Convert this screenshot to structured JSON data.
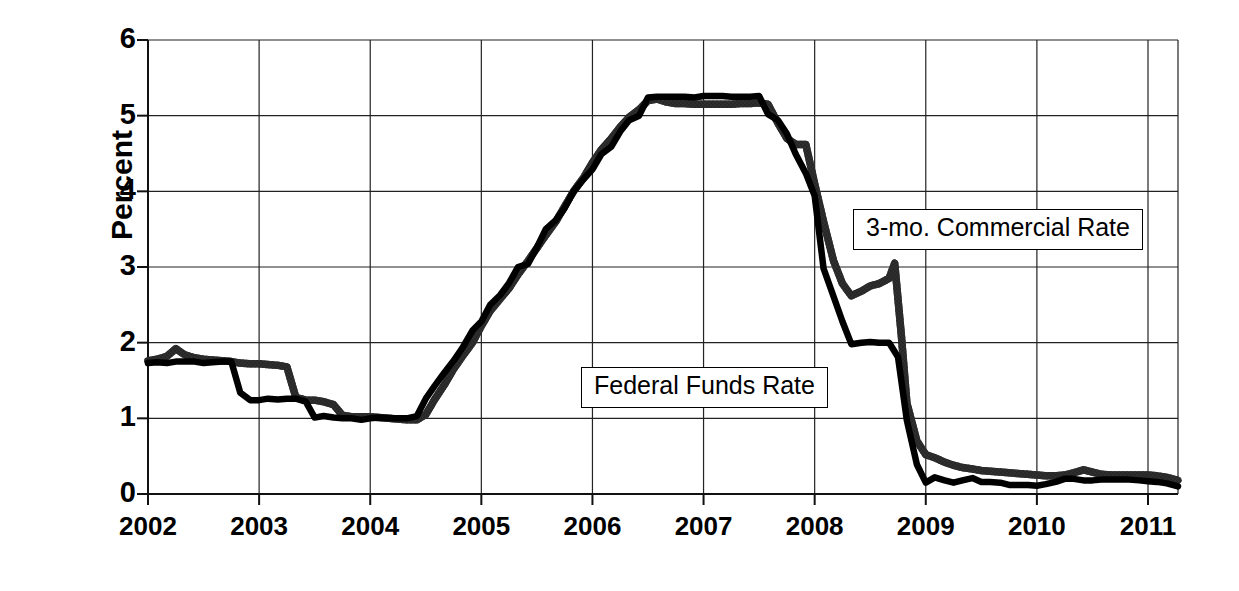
{
  "chart_data": {
    "type": "line",
    "title": "",
    "xlabel": "",
    "ylabel": "Percent",
    "xlim": [
      2002.0,
      2011.27
    ],
    "ylim": [
      0,
      6
    ],
    "grid": true,
    "yticks": [
      0,
      1,
      2,
      3,
      4,
      5,
      6
    ],
    "xticks": [
      2002,
      2003,
      2004,
      2005,
      2006,
      2007,
      2008,
      2009,
      2010,
      2011
    ],
    "ytick_labels": [
      "0",
      "1",
      "2",
      "3",
      "4",
      "5",
      "6"
    ],
    "xtick_labels": [
      "2002",
      "2003",
      "2004",
      "2005",
      "2006",
      "2007",
      "2008",
      "2009",
      "2010",
      "2011"
    ],
    "legend_position": "inline-callouts",
    "series": [
      {
        "name": "3-mo. Commercial Rate",
        "color": "#3a3a3a",
        "style": "textured-gray",
        "x": [
          2002.0,
          2002.08,
          2002.17,
          2002.25,
          2002.33,
          2002.42,
          2002.5,
          2002.58,
          2002.67,
          2002.75,
          2002.83,
          2002.92,
          2003.0,
          2003.08,
          2003.17,
          2003.25,
          2003.33,
          2003.42,
          2003.5,
          2003.58,
          2003.67,
          2003.75,
          2003.83,
          2003.92,
          2004.0,
          2004.08,
          2004.17,
          2004.25,
          2004.33,
          2004.42,
          2004.5,
          2004.58,
          2004.67,
          2004.75,
          2004.83,
          2004.92,
          2005.0,
          2005.08,
          2005.17,
          2005.25,
          2005.33,
          2005.42,
          2005.5,
          2005.58,
          2005.67,
          2005.75,
          2005.83,
          2005.92,
          2006.0,
          2006.08,
          2006.17,
          2006.25,
          2006.33,
          2006.42,
          2006.5,
          2006.58,
          2006.67,
          2006.75,
          2006.83,
          2006.92,
          2007.0,
          2007.08,
          2007.17,
          2007.25,
          2007.33,
          2007.42,
          2007.5,
          2007.58,
          2007.67,
          2007.75,
          2007.83,
          2007.92,
          2008.0,
          2008.08,
          2008.17,
          2008.25,
          2008.33,
          2008.42,
          2008.5,
          2008.58,
          2008.67,
          2008.72,
          2008.78,
          2008.83,
          2008.92,
          2009.0,
          2009.08,
          2009.17,
          2009.25,
          2009.33,
          2009.42,
          2009.5,
          2009.58,
          2009.67,
          2009.75,
          2009.83,
          2009.92,
          2010.0,
          2010.08,
          2010.17,
          2010.25,
          2010.33,
          2010.42,
          2010.5,
          2010.58,
          2010.67,
          2010.75,
          2010.83,
          2010.92,
          2011.0,
          2011.08,
          2011.17,
          2011.27
        ],
        "y": [
          1.76,
          1.78,
          1.82,
          1.92,
          1.84,
          1.8,
          1.78,
          1.77,
          1.76,
          1.75,
          1.73,
          1.72,
          1.72,
          1.71,
          1.7,
          1.68,
          1.28,
          1.24,
          1.24,
          1.22,
          1.18,
          1.04,
          1.02,
          1.02,
          1.02,
          1.01,
          1.0,
          0.99,
          0.98,
          0.98,
          1.05,
          1.25,
          1.45,
          1.65,
          1.82,
          2.0,
          2.22,
          2.42,
          2.58,
          2.72,
          2.9,
          3.08,
          3.25,
          3.42,
          3.6,
          3.8,
          4.0,
          4.18,
          4.38,
          4.55,
          4.7,
          4.85,
          4.98,
          5.08,
          5.2,
          5.22,
          5.18,
          5.16,
          5.16,
          5.15,
          5.15,
          5.15,
          5.15,
          5.15,
          5.16,
          5.16,
          5.17,
          5.15,
          4.9,
          4.7,
          4.62,
          4.62,
          4.1,
          3.6,
          3.08,
          2.78,
          2.62,
          2.68,
          2.75,
          2.78,
          2.85,
          3.05,
          2.1,
          1.2,
          0.7,
          0.52,
          0.48,
          0.42,
          0.38,
          0.35,
          0.33,
          0.31,
          0.3,
          0.29,
          0.28,
          0.27,
          0.26,
          0.25,
          0.24,
          0.24,
          0.25,
          0.28,
          0.32,
          0.29,
          0.26,
          0.25,
          0.25,
          0.25,
          0.25,
          0.25,
          0.24,
          0.22,
          0.18
        ]
      },
      {
        "name": "Federal Funds Rate",
        "color": "#000000",
        "style": "solid-black",
        "x": [
          2002.0,
          2002.08,
          2002.17,
          2002.25,
          2002.33,
          2002.42,
          2002.5,
          2002.58,
          2002.67,
          2002.75,
          2002.83,
          2002.92,
          2003.0,
          2003.08,
          2003.17,
          2003.25,
          2003.33,
          2003.42,
          2003.5,
          2003.58,
          2003.67,
          2003.75,
          2003.83,
          2003.92,
          2004.0,
          2004.08,
          2004.17,
          2004.25,
          2004.33,
          2004.42,
          2004.5,
          2004.58,
          2004.67,
          2004.75,
          2004.83,
          2004.92,
          2005.0,
          2005.08,
          2005.17,
          2005.25,
          2005.33,
          2005.42,
          2005.5,
          2005.58,
          2005.67,
          2005.75,
          2005.83,
          2005.92,
          2006.0,
          2006.08,
          2006.17,
          2006.25,
          2006.33,
          2006.42,
          2006.5,
          2006.58,
          2006.67,
          2006.75,
          2006.83,
          2006.92,
          2007.0,
          2007.08,
          2007.17,
          2007.25,
          2007.33,
          2007.42,
          2007.5,
          2007.58,
          2007.67,
          2007.75,
          2007.83,
          2007.92,
          2008.0,
          2008.08,
          2008.17,
          2008.25,
          2008.33,
          2008.42,
          2008.5,
          2008.58,
          2008.67,
          2008.75,
          2008.83,
          2008.92,
          2009.0,
          2009.08,
          2009.17,
          2009.25,
          2009.33,
          2009.42,
          2009.5,
          2009.58,
          2009.67,
          2009.75,
          2009.83,
          2009.92,
          2010.0,
          2010.08,
          2010.17,
          2010.25,
          2010.33,
          2010.42,
          2010.5,
          2010.58,
          2010.67,
          2010.75,
          2010.83,
          2010.92,
          2011.0,
          2011.08,
          2011.17,
          2011.27
        ],
        "y": [
          1.73,
          1.74,
          1.73,
          1.75,
          1.75,
          1.75,
          1.73,
          1.74,
          1.75,
          1.75,
          1.34,
          1.24,
          1.24,
          1.26,
          1.25,
          1.26,
          1.26,
          1.22,
          1.01,
          1.03,
          1.01,
          1.0,
          1.0,
          0.98,
          1.0,
          1.01,
          1.0,
          1.0,
          1.0,
          1.03,
          1.26,
          1.43,
          1.61,
          1.76,
          1.93,
          2.16,
          2.28,
          2.5,
          2.63,
          2.79,
          3.0,
          3.04,
          3.26,
          3.5,
          3.62,
          3.78,
          4.0,
          4.16,
          4.29,
          4.49,
          4.59,
          4.79,
          4.94,
          5.0,
          5.24,
          5.25,
          5.25,
          5.25,
          5.25,
          5.24,
          5.26,
          5.26,
          5.26,
          5.25,
          5.25,
          5.25,
          5.26,
          5.02,
          4.94,
          4.76,
          4.49,
          4.24,
          3.94,
          2.98,
          2.61,
          2.28,
          1.98,
          2.0,
          2.01,
          2.0,
          2.0,
          1.81,
          0.97,
          0.39,
          0.15,
          0.22,
          0.18,
          0.15,
          0.18,
          0.21,
          0.16,
          0.16,
          0.15,
          0.12,
          0.12,
          0.12,
          0.11,
          0.13,
          0.16,
          0.2,
          0.2,
          0.18,
          0.18,
          0.19,
          0.19,
          0.19,
          0.19,
          0.18,
          0.17,
          0.16,
          0.14,
          0.1
        ]
      }
    ],
    "annotations": [
      {
        "id": "commercial",
        "text": "3-mo. Commercial Rate"
      },
      {
        "id": "fedfunds",
        "text": "Federal Funds Rate"
      }
    ]
  },
  "axes": {
    "y_title": "Percent"
  }
}
